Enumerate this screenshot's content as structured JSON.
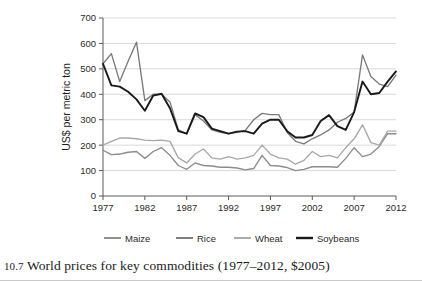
{
  "caption": {
    "number": "10.7",
    "text": "World prices for key commodities (1977–2012, $2005)"
  },
  "axis": {
    "ylabel": "US$ per metric ton",
    "yticks": [
      "0",
      "100",
      "200",
      "300",
      "400",
      "500",
      "600",
      "700"
    ],
    "xticks": [
      "1977",
      "1982",
      "1987",
      "1992",
      "1997",
      "2002",
      "2007",
      "2012"
    ]
  },
  "legend": {
    "items": [
      {
        "label": "Maize",
        "color": "#8c8c8c"
      },
      {
        "label": "Rice",
        "color": "#7a7a7a"
      },
      {
        "label": "Wheat",
        "color": "#a8a8a8"
      },
      {
        "label": "Soybeans",
        "color": "#1a1a1a"
      }
    ]
  },
  "chart_data": {
    "type": "line",
    "title": "World prices for key commodities (1977–2012, $2005)",
    "xlabel": "",
    "ylabel": "US$ per metric ton",
    "xlim": [
      1977,
      2012
    ],
    "ylim": [
      0,
      700
    ],
    "ytick_step": 100,
    "grid": "horizontal",
    "legend_position": "bottom",
    "x": [
      1977,
      1978,
      1979,
      1980,
      1981,
      1982,
      1983,
      1984,
      1985,
      1986,
      1987,
      1988,
      1989,
      1990,
      1991,
      1992,
      1993,
      1994,
      1995,
      1996,
      1997,
      1998,
      1999,
      2000,
      2001,
      2002,
      2003,
      2004,
      2005,
      2006,
      2007,
      2008,
      2009,
      2010,
      2011,
      2012
    ],
    "series": [
      {
        "name": "Maize",
        "color": "#8c8c8c",
        "values": [
          180,
          163,
          165,
          172,
          175,
          148,
          175,
          190,
          160,
          120,
          105,
          130,
          120,
          118,
          113,
          113,
          110,
          103,
          108,
          160,
          120,
          118,
          112,
          100,
          105,
          115,
          115,
          115,
          113,
          148,
          190,
          155,
          165,
          195,
          245,
          245
        ]
      },
      {
        "name": "Rice",
        "color": "#7a7a7a",
        "values": [
          520,
          560,
          450,
          530,
          605,
          375,
          400,
          400,
          370,
          260,
          245,
          320,
          295,
          260,
          250,
          245,
          250,
          258,
          300,
          325,
          320,
          320,
          250,
          215,
          205,
          225,
          240,
          260,
          290,
          305,
          330,
          555,
          470,
          440,
          430,
          475
        ]
      },
      {
        "name": "Wheat",
        "color": "#a8a8a8",
        "values": [
          200,
          215,
          228,
          228,
          225,
          220,
          218,
          220,
          215,
          150,
          130,
          165,
          185,
          150,
          145,
          155,
          145,
          150,
          160,
          200,
          165,
          150,
          145,
          125,
          140,
          175,
          155,
          160,
          150,
          190,
          225,
          280,
          210,
          200,
          255,
          255
        ]
      },
      {
        "name": "Soybeans",
        "color": "#1a1a1a",
        "values": [
          520,
          435,
          430,
          410,
          380,
          335,
          395,
          402,
          345,
          255,
          245,
          325,
          310,
          265,
          255,
          245,
          253,
          255,
          245,
          285,
          300,
          300,
          255,
          230,
          230,
          240,
          295,
          318,
          275,
          260,
          330,
          450,
          400,
          405,
          450,
          490
        ]
      }
    ]
  }
}
